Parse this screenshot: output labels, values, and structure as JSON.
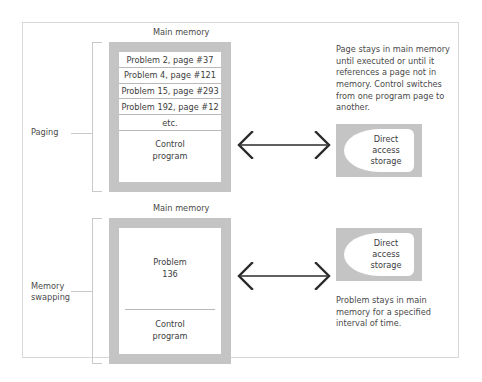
{
  "figure": {
    "sections": [
      {
        "bracket_label": "Paging",
        "memory_title": "Main memory",
        "list_items": [
          "Problem 2, page #37",
          "Problem 4, page #121",
          "Problem 15, page #293",
          "Problem 192, page #12",
          "etc."
        ],
        "control_program_line1": "Control",
        "control_program_line2": "program",
        "storage": {
          "line1": "Direct",
          "line2": "access",
          "line3": "storage"
        },
        "caption": "Page stays in main memory until executed or until it references a page not in memory. Control switches from one program page to another."
      },
      {
        "bracket_label_line1": "Memory",
        "bracket_label_line2": "swapping",
        "memory_title": "Main memory",
        "problem_line1": "Problem",
        "problem_line2": "136",
        "control_program_line1": "Control",
        "control_program_line2": "program",
        "storage": {
          "line1": "Direct",
          "line2": "access",
          "line3": "storage"
        },
        "caption": "Problem stays in main memory for a specified interval of time."
      }
    ]
  },
  "colors": {
    "frame_border": "#d8d8d8",
    "memory_fill": "#c4c4c4",
    "bracket": "#c9c9c9",
    "text": "#4a4a4a",
    "arrow": "#2b2b2b"
  }
}
